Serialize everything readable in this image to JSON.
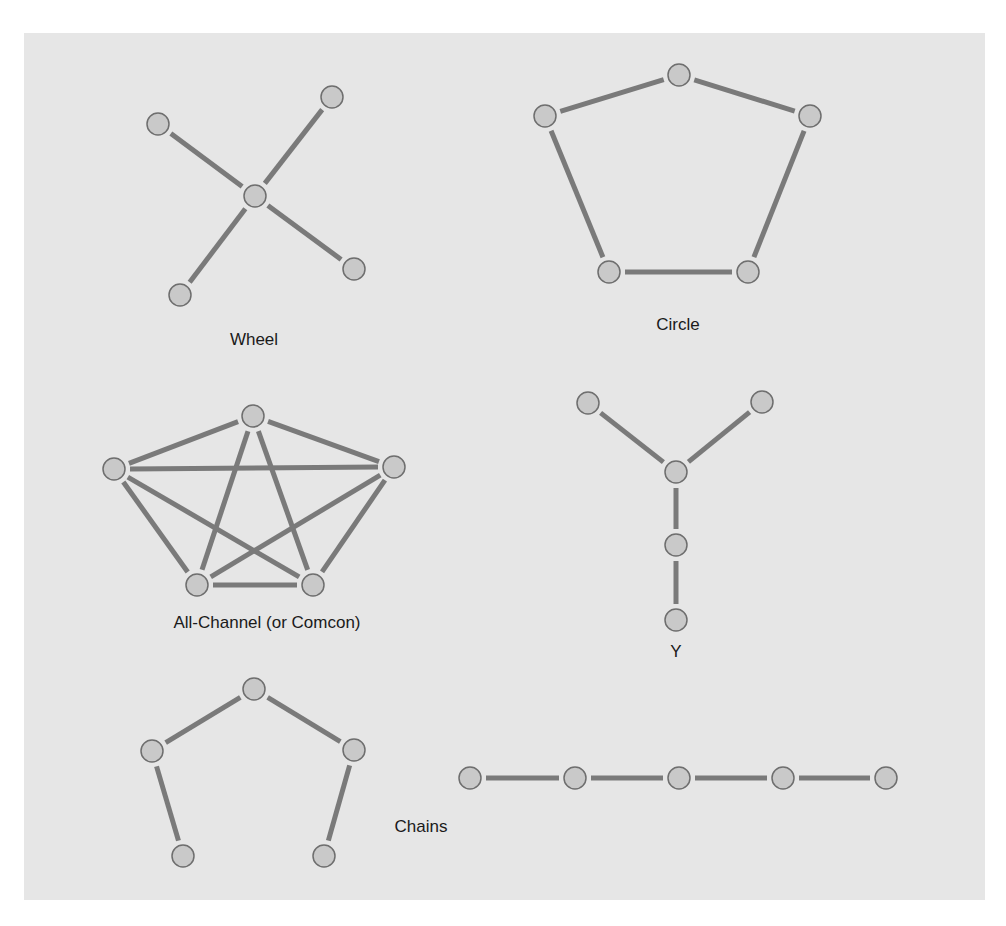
{
  "colors": {
    "background": "#ffffff",
    "panel": "#e6e6e6",
    "edge": "#7a7a7a",
    "node_fill": "#c9c9c9",
    "node_stroke": "#6e6e6e",
    "label": "#1a1a1a"
  },
  "networks": [
    {
      "id": "wheel",
      "label": "Wheel",
      "label_pos": [
        254,
        340
      ],
      "nodes": [
        [
          255,
          196
        ],
        [
          158,
          124
        ],
        [
          332,
          97
        ],
        [
          354,
          269
        ],
        [
          180,
          295
        ]
      ],
      "edges": [
        [
          0,
          1
        ],
        [
          0,
          2
        ],
        [
          0,
          3
        ],
        [
          0,
          4
        ]
      ]
    },
    {
      "id": "circle",
      "label": "Circle",
      "label_pos": [
        678,
        325
      ],
      "nodes": [
        [
          679,
          75
        ],
        [
          545,
          116
        ],
        [
          810,
          116
        ],
        [
          609,
          272
        ],
        [
          748,
          272
        ]
      ],
      "edges": [
        [
          0,
          1
        ],
        [
          0,
          2
        ],
        [
          1,
          3
        ],
        [
          2,
          4
        ],
        [
          3,
          4
        ]
      ]
    },
    {
      "id": "all-channel",
      "label": "All-Channel (or Comcon)",
      "label_pos": [
        267,
        623
      ],
      "nodes": [
        [
          253,
          416
        ],
        [
          114,
          469
        ],
        [
          394,
          467
        ],
        [
          197,
          585
        ],
        [
          313,
          585
        ]
      ],
      "edges": [
        [
          0,
          1
        ],
        [
          0,
          2
        ],
        [
          0,
          3
        ],
        [
          0,
          4
        ],
        [
          1,
          2
        ],
        [
          1,
          3
        ],
        [
          1,
          4
        ],
        [
          2,
          3
        ],
        [
          2,
          4
        ],
        [
          3,
          4
        ]
      ]
    },
    {
      "id": "y",
      "label": "Y",
      "label_pos": [
        676,
        652
      ],
      "nodes": [
        [
          588,
          403
        ],
        [
          762,
          402
        ],
        [
          676,
          472
        ],
        [
          676,
          545
        ],
        [
          676,
          620
        ]
      ],
      "edges": [
        [
          0,
          2
        ],
        [
          1,
          2
        ],
        [
          2,
          3
        ],
        [
          3,
          4
        ]
      ]
    },
    {
      "id": "chain-bent",
      "label": "Chains",
      "label_pos": [
        421,
        827
      ],
      "nodes": [
        [
          254,
          689
        ],
        [
          152,
          751
        ],
        [
          354,
          750
        ],
        [
          183,
          856
        ],
        [
          324,
          856
        ]
      ],
      "edges": [
        [
          0,
          1
        ],
        [
          0,
          2
        ],
        [
          1,
          3
        ],
        [
          2,
          4
        ]
      ]
    },
    {
      "id": "chain-straight",
      "label": "",
      "nodes": [
        [
          470,
          778
        ],
        [
          575,
          778
        ],
        [
          679,
          778
        ],
        [
          783,
          778
        ],
        [
          886,
          778
        ]
      ],
      "edges": [
        [
          0,
          1
        ],
        [
          1,
          2
        ],
        [
          2,
          3
        ],
        [
          3,
          4
        ]
      ]
    }
  ],
  "labels": {
    "wheel": "Wheel",
    "circle": "Circle",
    "all_channel": "All-Channel (or Comcon)",
    "y": "Y",
    "chains": "Chains"
  }
}
